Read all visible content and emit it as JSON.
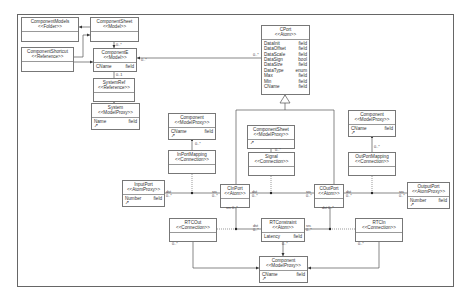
{
  "diagram": {
    "type": "uml-class-diagram",
    "classes": [
      {
        "id": "componentmodels",
        "name": "ComponentModels",
        "stereotype": "<<Folder>>",
        "attributes": [],
        "x": 21,
        "y": 17,
        "w": 58,
        "h": 25
      },
      {
        "id": "componentsheet_model",
        "name": "ComponentSheet",
        "stereotype": "<<Model>>",
        "attributes": [],
        "x": 90,
        "y": 17,
        "w": 49,
        "h": 25
      },
      {
        "id": "componentshortcut",
        "name": "ComponentShortcut",
        "stereotype": "<<Reference>>",
        "attributes": [],
        "x": 21,
        "y": 47,
        "w": 53,
        "h": 25
      },
      {
        "id": "component_model",
        "name": "ComponentE",
        "stereotype": "<<Model>>",
        "attributes": [
          {
            "name": "CName",
            "type": "field"
          }
        ],
        "x": 93,
        "y": 48,
        "w": 44,
        "h": 20
      },
      {
        "id": "systemref",
        "name": "SystemRef",
        "stereotype": "<<Reference>>",
        "attributes": [],
        "x": 93,
        "y": 78,
        "w": 42,
        "h": 20
      },
      {
        "id": "system",
        "name": "System",
        "stereotype": "<<ModelProxy>>",
        "attributes": [
          {
            "name": "Name",
            "type": "field"
          }
        ],
        "x": 91,
        "y": 103,
        "w": 49,
        "h": 25,
        "has_pin": true
      },
      {
        "id": "cport",
        "name": "CPort",
        "stereotype": "<<Atom>>",
        "attributes": [
          {
            "name": "DataInit",
            "type": "field"
          },
          {
            "name": "DataOffset",
            "type": "field"
          },
          {
            "name": "DataScale",
            "type": "field"
          },
          {
            "name": "DataSign",
            "type": "bool"
          },
          {
            "name": "DataSize",
            "type": "field"
          },
          {
            "name": "DataType",
            "type": "enum"
          },
          {
            "name": "Max",
            "type": "field"
          },
          {
            "name": "Min",
            "type": "field"
          },
          {
            "name": "CName",
            "type": "field"
          }
        ],
        "x": 261,
        "y": 25,
        "w": 49,
        "h": 70
      },
      {
        "id": "component_mp_left",
        "name": "Component",
        "stereotype": "<<ModelProxy>>",
        "attributes": [
          {
            "name": "CName",
            "type": "field"
          }
        ],
        "x": 168,
        "y": 113,
        "w": 48,
        "h": 26,
        "has_pin": true
      },
      {
        "id": "componentsheet_mp",
        "name": "ComponentSheet",
        "stereotype": "<<ModelProxy>>",
        "attributes": [],
        "x": 247,
        "y": 125,
        "w": 48,
        "h": 22,
        "has_pin": true
      },
      {
        "id": "component_mp_right",
        "name": "Component",
        "stereotype": "<<ModelProxy>>",
        "attributes": [
          {
            "name": "CName",
            "type": "field"
          }
        ],
        "x": 348,
        "y": 110,
        "w": 48,
        "h": 26,
        "has_pin": true
      },
      {
        "id": "inportmapping",
        "name": "InPortMapping",
        "stereotype": "<<Connection>>",
        "attributes": [],
        "x": 168,
        "y": 150,
        "w": 48,
        "h": 22
      },
      {
        "id": "signal",
        "name": "Signal",
        "stereotype": "<<Connection>>",
        "attributes": [],
        "x": 248,
        "y": 152,
        "w": 47,
        "h": 22
      },
      {
        "id": "outportmapping",
        "name": "OutPortMapping",
        "stereotype": "<<Connection>>",
        "attributes": [],
        "x": 348,
        "y": 152,
        "w": 48,
        "h": 22
      },
      {
        "id": "inputport",
        "name": "InputPort",
        "stereotype": "<<AtomProxy>>",
        "attributes": [
          {
            "name": "Number",
            "type": "field"
          }
        ],
        "x": 122,
        "y": 180,
        "w": 43,
        "h": 24,
        "has_pin": true
      },
      {
        "id": "cinport",
        "name": "CInPort",
        "stereotype": "<<Atom>>",
        "attributes": [],
        "x": 220,
        "y": 184,
        "w": 30,
        "h": 18
      },
      {
        "id": "coutport",
        "name": "COutPort",
        "stereotype": "<<Atom>>",
        "attributes": [],
        "x": 314,
        "y": 184,
        "w": 30,
        "h": 18
      },
      {
        "id": "outputport",
        "name": "OutputPort",
        "stereotype": "<<AtomProxy>>",
        "attributes": [
          {
            "name": "Number",
            "type": "field"
          }
        ],
        "x": 407,
        "y": 182,
        "w": 43,
        "h": 24,
        "has_pin": true
      },
      {
        "id": "rtcout",
        "name": "RTCOut",
        "stereotype": "<<Connection>>",
        "attributes": [],
        "x": 169,
        "y": 218,
        "w": 48,
        "h": 21
      },
      {
        "id": "rtconstraint",
        "name": "RTConstraint",
        "stereotype": "<<Atom>>",
        "attributes": [
          {
            "name": "Latency",
            "type": "field"
          }
        ],
        "x": 261,
        "y": 218,
        "w": 44,
        "h": 21
      },
      {
        "id": "rtcin",
        "name": "RTCIn",
        "stereotype": "<<Connection>>",
        "attributes": [],
        "x": 355,
        "y": 218,
        "w": 48,
        "h": 21
      },
      {
        "id": "component_mp_bottom",
        "name": "Component",
        "stereotype": "<<ModelProxy>>",
        "attributes": [
          {
            "name": "CName",
            "type": "field"
          }
        ],
        "x": 259,
        "y": 256,
        "w": 49,
        "h": 27,
        "has_pin": true
      }
    ],
    "labels": [
      {
        "text": "0..*",
        "x": 141,
        "y": 58
      },
      {
        "text": "0..*",
        "x": 116,
        "y": 43
      },
      {
        "text": "0..1",
        "x": 116,
        "y": 73
      },
      {
        "text": "0..*",
        "x": 253,
        "y": 53
      },
      {
        "text": "0..*",
        "x": 195,
        "y": 142
      },
      {
        "text": "0..*",
        "x": 275,
        "y": 148
      },
      {
        "text": "0..*",
        "x": 374,
        "y": 145
      },
      {
        "text": "dst",
        "x": 166,
        "y": 190
      },
      {
        "text": "0..*",
        "x": 166,
        "y": 194
      },
      {
        "text": "src",
        "x": 212,
        "y": 190
      },
      {
        "text": "0..*",
        "x": 212,
        "y": 194
      },
      {
        "text": "dst",
        "x": 252,
        "y": 190
      },
      {
        "text": "0..*",
        "x": 252,
        "y": 194
      },
      {
        "text": "src",
        "x": 306,
        "y": 190
      },
      {
        "text": "0..*",
        "x": 306,
        "y": 194
      },
      {
        "text": "dst",
        "x": 346,
        "y": 190
      },
      {
        "text": "0..*",
        "x": 346,
        "y": 194
      },
      {
        "text": "src",
        "x": 399,
        "y": 190
      },
      {
        "text": "0..*",
        "x": 399,
        "y": 194
      },
      {
        "text": "src 0..*",
        "x": 226,
        "y": 206
      },
      {
        "text": "dst 0..*",
        "x": 322,
        "y": 206
      },
      {
        "text": "dst",
        "x": 253,
        "y": 224
      },
      {
        "text": "0..*",
        "x": 253,
        "y": 228
      },
      {
        "text": "src",
        "x": 306,
        "y": 224
      },
      {
        "text": "0..*",
        "x": 306,
        "y": 228
      },
      {
        "text": "0..*",
        "x": 172,
        "y": 242
      },
      {
        "text": "0..*",
        "x": 282,
        "y": 242
      },
      {
        "text": "0..*",
        "x": 358,
        "y": 242
      }
    ]
  }
}
